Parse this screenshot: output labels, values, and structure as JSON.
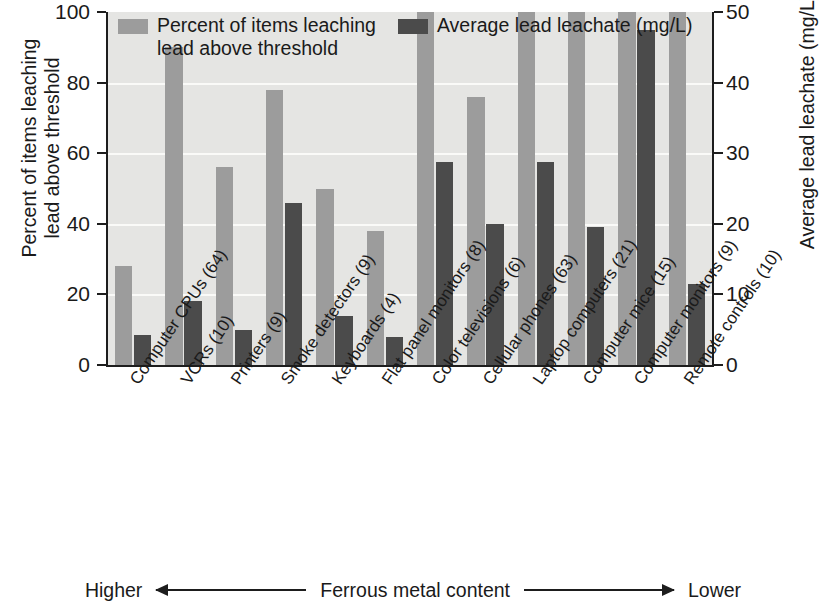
{
  "legend": {
    "series1_label": "Percent of items leaching\nlead above threshold",
    "series1_color": "#9c9c9c",
    "series2_label": "Average lead leachate (mg/L)",
    "series2_color": "#4b4b4b"
  },
  "axes": {
    "left_title": "Percent of items leaching\nlead above threshold",
    "right_title": "Average lead leachate (mg/L)",
    "left_ticks": [
      "0",
      "20",
      "40",
      "60",
      "80",
      "100"
    ],
    "right_ticks": [
      "0",
      "10",
      "20",
      "30",
      "40",
      "50"
    ]
  },
  "footer": {
    "left_label": "Higher",
    "center_label": "Ferrous metal content",
    "right_label": "Lower"
  },
  "chart_data": {
    "type": "bar",
    "title": "",
    "xlabel": "Ferrous metal content",
    "ylabel": "Percent of items leaching lead above threshold",
    "ylabel_right": "Average lead leachate (mg/L)",
    "ylim": [
      0,
      100
    ],
    "ylim_right": [
      0,
      50
    ],
    "grid": true,
    "legend_position": "top-left",
    "categories": [
      "Computer CPUs (64)",
      "VCRs (10)",
      "Printers (9)",
      "Smoke detectors (9)",
      "Keyboards (4)",
      "Flat panel monitors (8)",
      "Color televisions (6)",
      "Cellular phones (63)",
      "Laptop computers (21)",
      "Computer mice (15)",
      "Computer monitors (9)",
      "Remote controls (10)"
    ],
    "series": [
      {
        "name": "Percent of items leaching lead above threshold",
        "axis": "left",
        "units": "%",
        "color": "#9c9c9c",
        "values": [
          28,
          90,
          56,
          78,
          50,
          38,
          100,
          76,
          100,
          100,
          100,
          100
        ]
      },
      {
        "name": "Average lead leachate (mg/L)",
        "axis": "right",
        "units": "mg/L",
        "color": "#4b4b4b",
        "values": [
          4.2,
          9.0,
          5.0,
          23.0,
          7.0,
          4.0,
          28.7,
          20.0,
          28.7,
          19.6,
          47.5,
          11.5
        ]
      }
    ]
  }
}
